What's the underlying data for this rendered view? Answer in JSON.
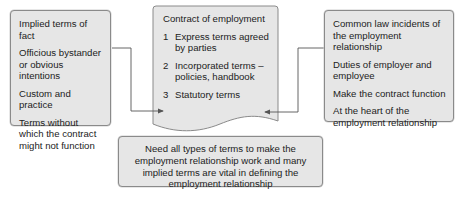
{
  "left_box": {
    "items": [
      "Implied terms of fact",
      "Officious bystander or obvious intentions",
      "Custom and practice",
      "Terms without which the contract might not function"
    ]
  },
  "center_doc": {
    "title": "Contract of employment",
    "items": [
      {
        "num": "1",
        "text": "Express terms agreed by parties"
      },
      {
        "num": "2",
        "text": "Incorporated terms – policies, handbook"
      },
      {
        "num": "3",
        "text": "Statutory terms"
      }
    ]
  },
  "right_box": {
    "items": [
      "Common law incidents of the employment relationship",
      "Duties of employer and employee",
      "Make the contract function",
      "At the heart of the employment relationship"
    ]
  },
  "bottom_box": {
    "text": "Need all types of terms to make the employment relationship work and many implied terms are vital in defining the employment relationship"
  },
  "colors": {
    "box_fill": "#e6e6e6",
    "border": "#8a8a8a",
    "line": "#555555"
  }
}
